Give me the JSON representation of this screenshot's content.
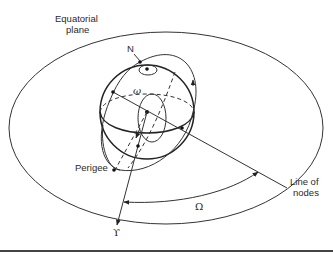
{
  "diagram": {
    "labels": {
      "equatorial_plane_line1": "Equatorial",
      "equatorial_plane_line2": "plane",
      "north": "N",
      "argument_of_perigee": "ω",
      "perigee": "Perigee",
      "line_of_nodes_line1": "Line of",
      "line_of_nodes_line2": "nodes",
      "raan": "Ω",
      "vernal_equinox": "ϒ"
    },
    "colors": {
      "stroke": "#333333",
      "background": "#ffffff"
    }
  }
}
